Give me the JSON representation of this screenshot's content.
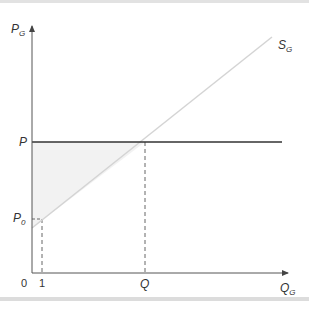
{
  "diagram": {
    "type": "supply-price-surplus",
    "y_axis": {
      "label": "P",
      "subscript": "G"
    },
    "x_axis": {
      "label": "Q",
      "subscript": "G"
    },
    "origin_label": "0",
    "price_line": {
      "label": "P"
    },
    "reservation_price": {
      "label": "P",
      "subscript": "0"
    },
    "quantity_marker_1": {
      "label": "1"
    },
    "equilibrium_quantity": {
      "label": "Q"
    },
    "supply_curve": {
      "label": "S",
      "subscript": "G"
    },
    "colors": {
      "axis": "#555555",
      "price_line": "#333333",
      "supply_line": "#d4d4d4",
      "shaded_area": "#f2f2f2",
      "dashed": "#666666",
      "rule": "#dcdcdc"
    }
  }
}
